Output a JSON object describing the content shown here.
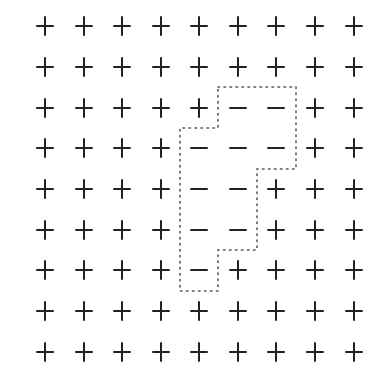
{
  "diagram": {
    "type": "spin-grid",
    "rows": 9,
    "cols": 9,
    "col_x": [
      45,
      84,
      122,
      161,
      199,
      238,
      276,
      315,
      354
    ],
    "row_y": [
      26,
      67,
      108,
      148,
      189,
      230,
      270,
      311,
      352
    ],
    "grid": [
      [
        "+",
        "+",
        "+",
        "+",
        "+",
        "+",
        "+",
        "+",
        "+"
      ],
      [
        "+",
        "+",
        "+",
        "+",
        "+",
        "+",
        "+",
        "+",
        "+"
      ],
      [
        "+",
        "+",
        "+",
        "+",
        "+",
        "-",
        "-",
        "+",
        "+"
      ],
      [
        "+",
        "+",
        "+",
        "+",
        "-",
        "-",
        "-",
        "+",
        "+"
      ],
      [
        "+",
        "+",
        "+",
        "+",
        "-",
        "-",
        "+",
        "+",
        "+"
      ],
      [
        "+",
        "+",
        "+",
        "+",
        "-",
        "-",
        "+",
        "+",
        "+"
      ],
      [
        "+",
        "+",
        "+",
        "+",
        "-",
        "+",
        "+",
        "+",
        "+"
      ],
      [
        "+",
        "+",
        "+",
        "+",
        "+",
        "+",
        "+",
        "+",
        "+"
      ],
      [
        "+",
        "+",
        "+",
        "+",
        "+",
        "+",
        "+",
        "+",
        "+"
      ]
    ],
    "cluster_outline": {
      "style": "dotted",
      "color": "#555555",
      "points": [
        [
          218,
          87
        ],
        [
          296,
          87
        ],
        [
          296,
          169
        ],
        [
          257,
          169
        ],
        [
          257,
          250
        ],
        [
          218,
          250
        ],
        [
          218,
          291
        ],
        [
          180,
          291
        ],
        [
          180,
          128
        ],
        [
          218,
          128
        ],
        [
          218,
          87
        ]
      ]
    },
    "symbol_color": "#222222"
  }
}
